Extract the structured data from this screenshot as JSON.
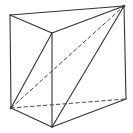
{
  "diagram": {
    "type": "triangular-prism",
    "stroke_color": "#333333",
    "background": "#ffffff",
    "vertices": {
      "A": [
        10,
        15
      ],
      "B": [
        52,
        33
      ],
      "C": [
        124,
        6
      ],
      "D": [
        11,
        108
      ],
      "E": [
        52,
        127
      ],
      "F": [
        126,
        99
      ]
    },
    "edges": [
      {
        "from": "A",
        "to": "B",
        "style": "solid"
      },
      {
        "from": "B",
        "to": "C",
        "style": "solid"
      },
      {
        "from": "A",
        "to": "C",
        "style": "solid"
      },
      {
        "from": "A",
        "to": "D",
        "style": "solid"
      },
      {
        "from": "B",
        "to": "E",
        "style": "solid"
      },
      {
        "from": "C",
        "to": "F",
        "style": "solid"
      },
      {
        "from": "D",
        "to": "E",
        "style": "solid"
      },
      {
        "from": "E",
        "to": "F",
        "style": "solid"
      },
      {
        "from": "D",
        "to": "F",
        "style": "dashed"
      },
      {
        "from": "D",
        "to": "B",
        "style": "solid"
      },
      {
        "from": "E",
        "to": "C",
        "style": "solid"
      },
      {
        "from": "D",
        "to": "C",
        "style": "dashed"
      }
    ]
  }
}
